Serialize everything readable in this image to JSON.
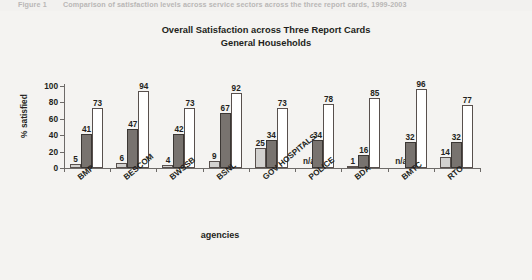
{
  "caption_strip": {
    "number": "Figure 1",
    "text": "Comparison of satisfaction levels across service sectors across the three report cards, 1999-2003"
  },
  "chart_data": {
    "type": "bar",
    "title": "Overall Satisfaction across Three Report Cards",
    "subtitle": "General Households",
    "xlabel": "agencies",
    "ylabel": "% satisfied",
    "ylim": [
      0,
      100
    ],
    "ytick_labels": [
      "0",
      "20",
      "40",
      "60",
      "80",
      "100"
    ],
    "yticks": [
      0,
      20,
      40,
      60,
      80,
      100
    ],
    "grid": false,
    "legend": "none",
    "categories": [
      "BMP",
      "BESCOM",
      "BWSSB",
      "BSNL",
      "GOV HOSPITALS",
      "POLICE",
      "BDA",
      "BMTC",
      "RTO"
    ],
    "series": [
      {
        "name": "Report Card 1",
        "color": "#d2d1cf",
        "values": [
          5,
          6,
          4,
          9,
          25,
          null,
          1,
          null,
          14
        ],
        "labels": [
          "5",
          "6",
          "4",
          "9",
          "25",
          "n/a",
          "1",
          "n/a",
          "14"
        ]
      },
      {
        "name": "Report Card 2",
        "color": "#78736f",
        "values": [
          41,
          47,
          42,
          67,
          34,
          34,
          16,
          32,
          32
        ],
        "labels": [
          "41",
          "47",
          "42",
          "67",
          "34",
          "34",
          "16",
          "32",
          "32"
        ]
      },
      {
        "name": "Report Card 3",
        "color": "#ffffff",
        "values": [
          73,
          94,
          73,
          92,
          73,
          78,
          85,
          96,
          77
        ],
        "labels": [
          "73",
          "94",
          "73",
          "92",
          "73",
          "78",
          "85",
          "96",
          "77"
        ]
      }
    ]
  }
}
